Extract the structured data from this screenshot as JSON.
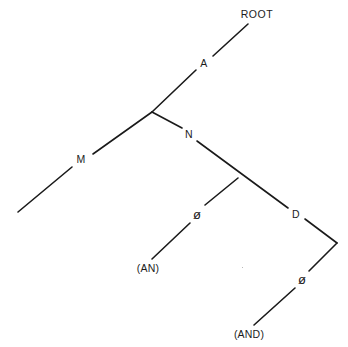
{
  "figure": {
    "type": "syntax-parse-tree",
    "background_color": "#ffffff",
    "line_color": "#1a1a1a",
    "text_color": "#1c1c1c",
    "width": 348,
    "height": 347
  },
  "nodes": [
    {
      "id": "root",
      "label": "ROOT",
      "x": 257,
      "y": 14,
      "kind": "root"
    },
    {
      "id": "a",
      "label": "A",
      "x": 204,
      "y": 63,
      "kind": "nonterminal"
    },
    {
      "id": "m",
      "label": "M",
      "x": 81,
      "y": 159,
      "kind": "nonterminal"
    },
    {
      "id": "n",
      "label": "N",
      "x": 189,
      "y": 134,
      "kind": "nonterminal"
    },
    {
      "id": "phi1",
      "label": "ø",
      "x": 197,
      "y": 214,
      "kind": "nullset"
    },
    {
      "id": "d",
      "label": "D",
      "x": 296,
      "y": 214,
      "kind": "nonterminal"
    },
    {
      "id": "phi2",
      "label": "ø",
      "x": 302,
      "y": 279,
      "kind": "nullset"
    },
    {
      "id": "an",
      "label": "(AN)",
      "x": 148,
      "y": 268,
      "kind": "terminal"
    },
    {
      "id": "and",
      "label": "(AND)",
      "x": 249,
      "y": 334,
      "kind": "terminal"
    }
  ],
  "edges": [
    {
      "id": "edge-root-a",
      "from": "root",
      "to": "a",
      "x1": 248,
      "y1": 24,
      "x2": 213,
      "y2": 56
    },
    {
      "id": "edge-a-junction",
      "from": "a",
      "to": "junction1",
      "x1": 196,
      "y1": 70,
      "x2": 152,
      "y2": 112
    },
    {
      "id": "edge-junction-m",
      "from": "junction1",
      "to": "m",
      "x1": 152,
      "y1": 112,
      "x2": 93,
      "y2": 154
    },
    {
      "id": "edge-junction-n",
      "from": "junction1",
      "to": "n",
      "x1": 152,
      "y1": 112,
      "x2": 182,
      "y2": 128
    },
    {
      "id": "edge-m-leaf",
      "from": "m",
      "to": "m-leaf",
      "x1": 72,
      "y1": 167,
      "x2": 18,
      "y2": 212
    },
    {
      "id": "edge-n-d",
      "from": "n",
      "to": "d",
      "x1": 197,
      "y1": 141,
      "x2": 288,
      "y2": 208
    },
    {
      "id": "edge-junction-phi1",
      "from": "junction2",
      "to": "phi1",
      "x1": 238,
      "y1": 178,
      "x2": 205,
      "y2": 205
    },
    {
      "id": "edge-d-vertex",
      "from": "d",
      "to": "vertex",
      "x1": 305,
      "y1": 219,
      "x2": 337,
      "y2": 243
    },
    {
      "id": "edge-vertex-phi2",
      "from": "vertex",
      "to": "phi2",
      "x1": 337,
      "y1": 243,
      "x2": 309,
      "y2": 271
    },
    {
      "id": "edge-phi1-an",
      "from": "phi1",
      "to": "an",
      "x1": 190,
      "y1": 223,
      "x2": 152,
      "y2": 259
    },
    {
      "id": "edge-phi2-and",
      "from": "phi2",
      "to": "and",
      "x1": 295,
      "y1": 288,
      "x2": 254,
      "y2": 325
    }
  ],
  "junctions": [
    {
      "id": "junction1",
      "x": 152,
      "y": 112
    },
    {
      "id": "junction2",
      "x": 238,
      "y": 178
    },
    {
      "id": "vertex",
      "x": 337,
      "y": 243
    }
  ],
  "speck": {
    "x": 242,
    "y": 267
  }
}
